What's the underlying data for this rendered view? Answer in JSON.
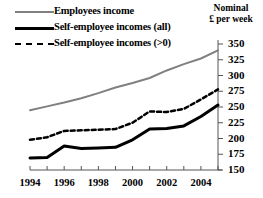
{
  "legend": {
    "items": [
      {
        "label": "Employees income",
        "style": "solid-gray",
        "color": "#808080"
      },
      {
        "label": "Self-employee incomes (all)",
        "style": "solid-black-thick",
        "color": "#000000"
      },
      {
        "label": "Self-employee incomes (>0)",
        "style": "dashed-black",
        "color": "#000000"
      }
    ]
  },
  "axis_caption": {
    "line1": "Nominal",
    "line2": "£ per week"
  },
  "chart_data": {
    "type": "line",
    "title": "",
    "subtitle": "",
    "xlabel": "",
    "ylabel": "Nominal £ per week",
    "x": [
      1994,
      1995,
      1996,
      1997,
      1998,
      1999,
      2000,
      2001,
      2002,
      2003,
      2004,
      2005
    ],
    "xtick_labels": [
      "1994",
      "1996",
      "1998",
      "2000",
      "2002",
      "2004"
    ],
    "xtick_values": [
      1994,
      1996,
      1998,
      2000,
      2002,
      2004
    ],
    "xlim": [
      1994,
      2005
    ],
    "ylim": [
      150,
      350
    ],
    "ytick_labels": [
      "150",
      "175",
      "200",
      "225",
      "250",
      "275",
      "300",
      "325",
      "350"
    ],
    "ytick_values": [
      150,
      175,
      200,
      225,
      250,
      275,
      300,
      325,
      350
    ],
    "grid": false,
    "legend_position": "top-left",
    "series": [
      {
        "name": "Employees income",
        "color": "#808080",
        "style": "solid",
        "width": 2,
        "values": [
          245,
          251,
          257,
          264,
          272,
          281,
          288,
          296,
          308,
          318,
          327,
          340
        ]
      },
      {
        "name": "Self-employee incomes (all)",
        "color": "#000000",
        "style": "solid",
        "width": 3,
        "values": [
          169,
          170,
          188,
          184,
          185,
          186,
          198,
          215,
          216,
          220,
          235,
          253
        ]
      },
      {
        "name": "Self-employee incomes (>0)",
        "color": "#000000",
        "style": "dashed",
        "width": 2.5,
        "values": [
          198,
          202,
          212,
          213,
          214,
          215,
          225,
          243,
          242,
          247,
          262,
          278
        ]
      }
    ]
  }
}
